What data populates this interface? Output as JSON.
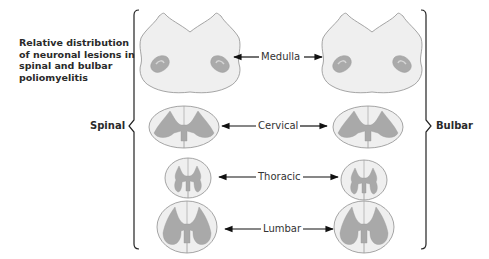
{
  "title": "Relative distribution of neuronal lesions in spinal and bulbar poliomyelitis",
  "groups": {
    "left": "Spinal",
    "right": "Bulbar"
  },
  "levels": [
    {
      "name": "Medulla",
      "section": "medulla"
    },
    {
      "name": "Cervical",
      "section": "spinal-cord"
    },
    {
      "name": "Thoracic",
      "section": "spinal-cord"
    },
    {
      "name": "Lumbar",
      "section": "spinal-cord"
    }
  ],
  "colors": {
    "white_matter": "#eeeeee",
    "gray_matter": "#a9a9a9",
    "outline": "#888888",
    "arrow": "#111111",
    "bracket": "#222222"
  }
}
